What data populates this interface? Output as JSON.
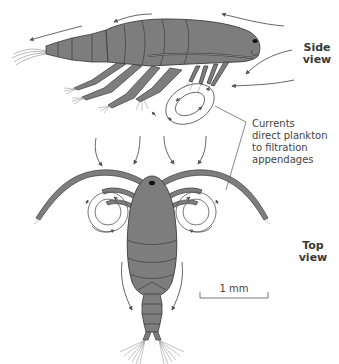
{
  "figure": {
    "colors": {
      "body": "#7d7d7d",
      "outline": "#3c3c3c",
      "arrow": "#555555",
      "background": "#ffffff",
      "text": "#3a3a3a"
    }
  },
  "labels": {
    "side_view_line1": "Side",
    "side_view_line2": "view",
    "top_view_line1": "Top",
    "top_view_line2": "view",
    "callout_line1": "Currents",
    "callout_line2": "direct plankton",
    "callout_line3": "to filtration",
    "callout_line4": "appendages",
    "scale_bar": "1 mm"
  }
}
